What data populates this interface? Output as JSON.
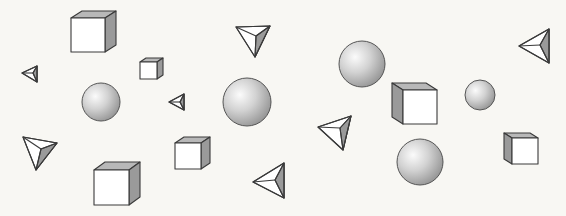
{
  "scene": {
    "background": "#f8f7f3",
    "shapes": [
      {
        "type": "cube",
        "name": "cube-top-left",
        "x": 71,
        "y": 18,
        "s": 34,
        "dx": 11,
        "dy": -7,
        "shade": "right"
      },
      {
        "type": "cube",
        "name": "cube-small-top",
        "x": 140,
        "y": 62,
        "s": 17,
        "dx": 6,
        "dy": -4,
        "shade": "right"
      },
      {
        "type": "cube",
        "name": "cube-mid-bottom",
        "x": 175,
        "y": 143,
        "s": 26,
        "dx": 9,
        "dy": -6,
        "shade": "right"
      },
      {
        "type": "cube",
        "name": "cube-bottom-left",
        "x": 94,
        "y": 170,
        "s": 35,
        "dx": 11,
        "dy": -8,
        "shade": "right"
      },
      {
        "type": "cube",
        "name": "cube-right-center",
        "x": 403,
        "y": 90,
        "s": 34,
        "dx": -11,
        "dy": -7,
        "shade": "left"
      },
      {
        "type": "cube",
        "name": "cube-far-right",
        "x": 512,
        "y": 138,
        "s": 26,
        "dx": -8,
        "dy": -5,
        "shade": "left"
      },
      {
        "type": "sphere",
        "name": "sphere-left",
        "cx": 101,
        "cy": 102,
        "r": 19
      },
      {
        "type": "sphere",
        "name": "sphere-center",
        "cx": 247,
        "cy": 102,
        "r": 24
      },
      {
        "type": "sphere",
        "name": "sphere-top-right",
        "cx": 362,
        "cy": 64,
        "r": 23
      },
      {
        "type": "sphere",
        "name": "sphere-bottom-right",
        "cx": 420,
        "cy": 162,
        "r": 23
      },
      {
        "type": "sphere",
        "name": "sphere-far-right",
        "cx": 480,
        "cy": 95,
        "r": 15
      },
      {
        "type": "tetra",
        "name": "tetra-top-center",
        "pts": [
          [
            236,
            27
          ],
          [
            270,
            26
          ],
          [
            255,
            57
          ]
        ],
        "c": [
          256,
          36
        ],
        "shadeIdx": [
          1,
          2
        ]
      },
      {
        "type": "tetra",
        "name": "tetra-left-small",
        "pts": [
          [
            22,
            73
          ],
          [
            37,
            66
          ],
          [
            37,
            82
          ]
        ],
        "c": [
          33,
          73
        ],
        "shadeIdx": [
          1,
          2
        ]
      },
      {
        "type": "tetra",
        "name": "tetra-center-small",
        "pts": [
          [
            169,
            102
          ],
          [
            184,
            94
          ],
          [
            184,
            110
          ]
        ],
        "c": [
          180,
          102
        ],
        "shadeIdx": [
          1,
          2
        ]
      },
      {
        "type": "tetra",
        "name": "tetra-bottom-left",
        "pts": [
          [
            23,
            137
          ],
          [
            57,
            143
          ],
          [
            36,
            170
          ]
        ],
        "c": [
          41,
          149
        ],
        "shadeIdx": [
          1,
          2
        ]
      },
      {
        "type": "tetra",
        "name": "tetra-bottom-center",
        "pts": [
          [
            253,
            182
          ],
          [
            284,
            163
          ],
          [
            284,
            198
          ]
        ],
        "c": [
          275,
          180
        ],
        "shadeIdx": [
          1,
          2
        ]
      },
      {
        "type": "tetra",
        "name": "tetra-right-mid",
        "pts": [
          [
            318,
            127
          ],
          [
            351,
            116
          ],
          [
            343,
            150
          ]
        ],
        "c": [
          340,
          128
        ],
        "shadeIdx": [
          1,
          2
        ]
      },
      {
        "type": "tetra",
        "name": "tetra-top-right",
        "pts": [
          [
            519,
            46
          ],
          [
            549,
            29
          ],
          [
            549,
            63
          ]
        ],
        "c": [
          540,
          45
        ],
        "shadeIdx": [
          1,
          2
        ]
      }
    ]
  }
}
